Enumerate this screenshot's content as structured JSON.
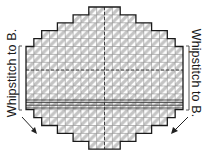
{
  "diagram": {
    "type": "plastic-canvas-chart",
    "shape": "stepped-oval",
    "grid": {
      "columns": 20,
      "rows": 18,
      "row_widths_in_cells": [
        4,
        8,
        12,
        16,
        18,
        20,
        20,
        20,
        20,
        20,
        20,
        20,
        20,
        18,
        16,
        12,
        8,
        4
      ],
      "stitch_pattern": "diagonal-tent-stitch",
      "center_lines": "dashed",
      "bold_band_rows": "lower-middle band of horizontal lines"
    },
    "colors": {
      "outline": "#1a1a1a",
      "stitch_fill": "#c8c8c8",
      "grid_line": "#8a8a8a",
      "background": "#ffffff"
    }
  },
  "labels": {
    "left": "Whipstitch to B.",
    "right": "Whipstitch to B."
  },
  "annotations": {
    "left_bracket": "bracket-left",
    "right_bracket": "bracket-right",
    "left_arrow": "arrow-down-right",
    "right_arrow": "arrow-down-left"
  }
}
